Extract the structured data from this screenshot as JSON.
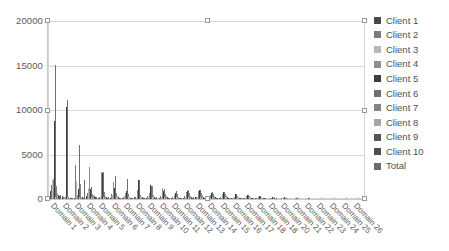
{
  "chart_data": {
    "type": "bar",
    "title": "",
    "subtitle": "",
    "xlabel": "",
    "ylabel": "",
    "ylim": [
      0,
      20000
    ],
    "ytick_labels": [
      "0",
      "5000",
      "10000",
      "15000",
      "20000"
    ],
    "ytick_values": [
      0,
      5000,
      10000,
      15000,
      20000
    ],
    "grid": true,
    "legend_position": "right",
    "categories": [
      "Domain 1",
      "Domain 2",
      "Domain 3",
      "Domain 4",
      "Domain 5",
      "Domain 6",
      "Domain 7",
      "Domain 8",
      "Domain 9",
      "Domain 10",
      "Domain 11",
      "Domain 12",
      "Domain 13",
      "Domain 14",
      "Domain 15",
      "Domain 16",
      "Domain 17",
      "Domain 18",
      "Domain 18",
      "Domain 20",
      "Domain 21",
      "Domain 22",
      "Domain 23",
      "Domain 24",
      "Domain 25",
      "Domain 26"
    ],
    "series": [
      {
        "name": "Client 1",
        "color": "#4a4a4a",
        "values": [
          900,
          300,
          120,
          350,
          150,
          160,
          120,
          180,
          140,
          120,
          90,
          110,
          180,
          90,
          140,
          60,
          70,
          60,
          40,
          40,
          30,
          20,
          20,
          10,
          10,
          10
        ]
      },
      {
        "name": "Client 2",
        "color": "#7c7c7c",
        "values": [
          1600,
          260,
          3800,
          700,
          280,
          600,
          260,
          200,
          380,
          300,
          230,
          300,
          200,
          170,
          200,
          150,
          130,
          120,
          80,
          60,
          40,
          30,
          20,
          20,
          10,
          10
        ]
      },
      {
        "name": "Client 3",
        "color": "#b8b8b8",
        "values": [
          2100,
          200,
          2000,
          1200,
          260,
          400,
          380,
          150,
          200,
          200,
          140,
          200,
          190,
          140,
          150,
          110,
          100,
          90,
          60,
          50,
          40,
          30,
          20,
          15,
          10,
          10
        ]
      },
      {
        "name": "Client 4",
        "color": "#8e8e8e",
        "values": [
          2300,
          180,
          500,
          3600,
          3000,
          1900,
          700,
          1000,
          650,
          1200,
          420,
          780,
          900,
          500,
          620,
          240,
          320,
          230,
          170,
          120,
          80,
          50,
          40,
          20,
          15,
          10
        ]
      },
      {
        "name": "Client 5",
        "color": "#3c3c3c",
        "values": [
          8800,
          10400,
          1100,
          1100,
          2900,
          1200,
          950,
          2200,
          1550,
          900,
          680,
          880,
          1050,
          700,
          750,
          520,
          430,
          350,
          260,
          180,
          110,
          70,
          50,
          30,
          20,
          15
        ]
      },
      {
        "name": "Client 6",
        "color": "#6e6e6e",
        "values": [
          15100,
          11200,
          6100,
          1400,
          3000,
          2550,
          2250,
          2100,
          1500,
          1150,
          900,
          980,
          1050,
          760,
          780,
          560,
          470,
          380,
          280,
          190,
          120,
          80,
          50,
          35,
          20,
          15
        ]
      },
      {
        "name": "Client 7",
        "color": "#858585",
        "values": [
          1500,
          230,
          1650,
          620,
          800,
          700,
          560,
          500,
          1450,
          620,
          520,
          700,
          720,
          520,
          560,
          380,
          330,
          250,
          180,
          130,
          90,
          55,
          35,
          25,
          15,
          10
        ]
      },
      {
        "name": "Client 8",
        "color": "#a6a6a6",
        "values": [
          700,
          150,
          260,
          420,
          300,
          350,
          250,
          260,
          480,
          380,
          280,
          380,
          420,
          300,
          320,
          210,
          190,
          150,
          110,
          80,
          55,
          35,
          25,
          15,
          10,
          8
        ]
      },
      {
        "name": "Client 9",
        "color": "#565656",
        "values": [
          450,
          120,
          180,
          300,
          200,
          180,
          160,
          200,
          250,
          210,
          170,
          220,
          240,
          180,
          190,
          130,
          110,
          90,
          65,
          45,
          30,
          20,
          15,
          10,
          8,
          5
        ]
      },
      {
        "name": "Client 10",
        "color": "#4f4f4f",
        "values": [
          300,
          100,
          140,
          200,
          140,
          120,
          110,
          130,
          160,
          140,
          110,
          150,
          160,
          120,
          130,
          90,
          75,
          60,
          45,
          30,
          20,
          15,
          10,
          8,
          5,
          4
        ]
      },
      {
        "name": "Total",
        "color": "#6a6a6a",
        "values": [
          420,
          140,
          2150,
          260,
          180,
          160,
          150,
          160,
          200,
          170,
          140,
          180,
          200,
          150,
          160,
          110,
          95,
          75,
          55,
          40,
          28,
          18,
          12,
          8,
          6,
          4
        ]
      }
    ]
  },
  "legend": {
    "items": [
      {
        "label": "Client 1",
        "color": "#4a4a4a"
      },
      {
        "label": "Client 2",
        "color": "#7c7c7c"
      },
      {
        "label": "Client 3",
        "color": "#b8b8b8"
      },
      {
        "label": "Client 4",
        "color": "#8e8e8e"
      },
      {
        "label": "Client 5",
        "color": "#3c3c3c"
      },
      {
        "label": "Client 6",
        "color": "#6e6e6e"
      },
      {
        "label": "Client 7",
        "color": "#858585"
      },
      {
        "label": "Client 8",
        "color": "#a6a6a6"
      },
      {
        "label": "Client 9",
        "color": "#565656"
      },
      {
        "label": "Client 10",
        "color": "#4f4f4f"
      },
      {
        "label": "Total",
        "color": "#6a6a6a"
      }
    ]
  },
  "selection": {
    "active": true,
    "handle_color": "#ffffff",
    "handle_border": "#9a9a9a",
    "handles": [
      {
        "x": 45,
        "y": 18
      },
      {
        "x": 205,
        "y": 18
      },
      {
        "x": 362,
        "y": 18
      },
      {
        "x": 45,
        "y": 108
      },
      {
        "x": 362,
        "y": 108
      },
      {
        "x": 45,
        "y": 196
      },
      {
        "x": 205,
        "y": 196
      },
      {
        "x": 362,
        "y": 196
      }
    ]
  },
  "colors": {
    "grid": "#d9d9d9",
    "axis": "#c9c9c9",
    "text": "#5a5a5a",
    "background": "#ffffff"
  }
}
